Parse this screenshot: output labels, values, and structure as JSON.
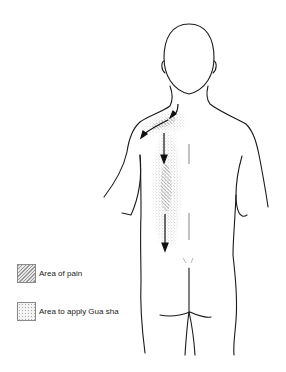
{
  "legend": {
    "items": [
      {
        "label": "Area of pain",
        "pattern": "hatched"
      },
      {
        "label": "Area to apply Gua sha",
        "pattern": "stippled"
      }
    ]
  },
  "colors": {
    "line": "#1a1a1a",
    "hatch": "#8a8a8a",
    "stipple": "#9a9a9a",
    "background": "#ffffff"
  }
}
